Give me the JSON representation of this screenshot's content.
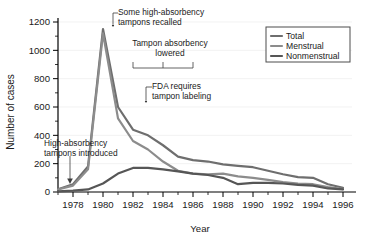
{
  "chart_data": {
    "type": "line",
    "title": "",
    "xlabel": "Year",
    "ylabel": "Number of cases",
    "xlim": [
      1977,
      1996.6
    ],
    "ylim": [
      0,
      1200
    ],
    "grid": true,
    "legend_position": "top-right",
    "xticks": [
      1978,
      1980,
      1982,
      1984,
      1986,
      1988,
      1990,
      1992,
      1994,
      1996
    ],
    "xtick_labels": [
      "1978",
      "1980",
      "1982",
      "1984",
      "1986",
      "1988",
      "1990",
      "1992",
      "1994",
      "1996"
    ],
    "yticks": [
      0,
      200,
      400,
      600,
      800,
      1000,
      1200
    ],
    "ytick_labels": [
      "0",
      "200",
      "400",
      "600",
      "800",
      "1000",
      "1200"
    ],
    "x": [
      1977,
      1978,
      1979,
      1980,
      1981,
      1982,
      1983,
      1984,
      1985,
      1986,
      1987,
      1988,
      1989,
      1990,
      1991,
      1992,
      1993,
      1994,
      1995,
      1996
    ],
    "series": [
      {
        "name": "Total",
        "color": "#6e6e6e",
        "values": [
          20,
          55,
          180,
          1150,
          600,
          440,
          400,
          330,
          250,
          225,
          215,
          195,
          185,
          175,
          150,
          125,
          105,
          100,
          55,
          30
        ]
      },
      {
        "name": "Menstrual",
        "color": "#8c8c8c",
        "values": [
          18,
          45,
          160,
          1120,
          520,
          360,
          300,
          215,
          150,
          130,
          125,
          130,
          110,
          100,
          85,
          70,
          60,
          55,
          35,
          20
        ]
      },
      {
        "name": "Nonmenstrual",
        "color": "#565656",
        "values": [
          5,
          10,
          18,
          60,
          130,
          170,
          170,
          160,
          145,
          130,
          120,
          100,
          55,
          65,
          65,
          60,
          50,
          45,
          25,
          18
        ]
      }
    ],
    "annotations": [
      {
        "id": "recall",
        "text_lines": [
          "Some high-absorbency",
          "tampons recalled"
        ],
        "points_to_year": 1980,
        "points_to_value": 1150
      },
      {
        "id": "absorbency-lowered",
        "text_lines": [
          "Tampon absorbency",
          "lowered"
        ],
        "bracket_from_year": 1982,
        "bracket_to_year": 1986
      },
      {
        "id": "fda-labeling",
        "text_lines": [
          "FDA requires",
          "tampon labeling"
        ],
        "points_to_year": 1982,
        "points_to_value": 640
      },
      {
        "id": "introduced",
        "text_lines": [
          "High-absorbency",
          "tampons introduced"
        ],
        "points_to_year": 1978,
        "points_to_value": 55
      }
    ],
    "legend": [
      {
        "label": "Total",
        "color": "#6e6e6e"
      },
      {
        "label": "Menstrual",
        "color": "#8c8c8c"
      },
      {
        "label": "Nonmenstrual",
        "color": "#565656"
      }
    ]
  }
}
